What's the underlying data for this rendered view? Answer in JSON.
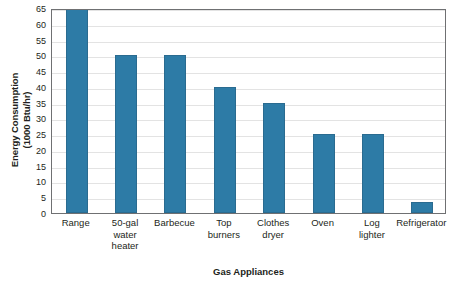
{
  "chart_data": {
    "type": "bar",
    "title": "",
    "xlabel": "Gas Appliances",
    "ylabel": "Energy Consumption (1000 Btu/hr)",
    "ylabel_lines": [
      "Energy Consumption",
      "(1000 Btu/hr)"
    ],
    "categories": [
      "Range",
      "50-gal water heater",
      "Barbecue",
      "Top burners",
      "Clothes dryer",
      "Oven",
      "Log lighter",
      "Refrigerator"
    ],
    "category_label_lines": [
      [
        "Range"
      ],
      [
        "50-gal",
        "water",
        "heater"
      ],
      [
        "Barbecue"
      ],
      [
        "Top",
        "burners"
      ],
      [
        "Clothes",
        "dryer"
      ],
      [
        "Oven"
      ],
      [
        "Log",
        "lighter"
      ],
      [
        "Refrigerator"
      ]
    ],
    "values": [
      65,
      50,
      50,
      40,
      35,
      25,
      25,
      3.5
    ],
    "ylim": [
      0,
      65
    ],
    "ytick_step": 5,
    "yticks": [
      0,
      5,
      10,
      15,
      20,
      25,
      30,
      35,
      40,
      45,
      50,
      55,
      60,
      65
    ],
    "ytick_labels": [
      "0",
      "5",
      "10",
      "15",
      "20",
      "25",
      "30",
      "35",
      "40",
      "45",
      "50",
      "55",
      "60",
      "65"
    ],
    "grid": true,
    "grid_axis": "y",
    "legend": false,
    "legend_position": "none",
    "bar_color": "#2d7ba6",
    "bar_edge_color": "#2a6b90",
    "grid_color": "#e3e3e3",
    "axis_color": "#6f7072",
    "text_color": "#231f20"
  }
}
